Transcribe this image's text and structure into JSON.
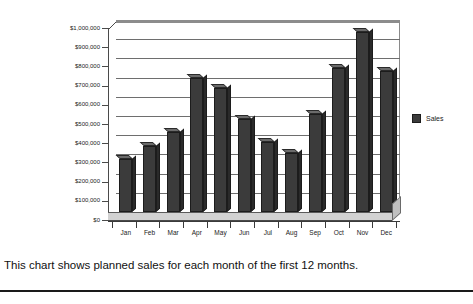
{
  "caption": "This chart shows planned sales for each month of the first 12 months.",
  "legend": {
    "label": "Sales",
    "swatch_color": "#3b3b3b"
  },
  "axis": {
    "y_tick_labels": [
      "$1,000,000",
      "$900,000",
      "$800,000",
      "$700,000",
      "$600,000",
      "$500,000",
      "$400,000",
      "$300,000",
      "$200,000",
      "$100,000",
      "$0"
    ]
  },
  "chart_data": {
    "type": "bar",
    "title": "",
    "subtitle": "",
    "xlabel": "",
    "ylabel": "",
    "categories": [
      "Jan",
      "Feb",
      "Mar",
      "Apr",
      "May",
      "Jun",
      "Jul",
      "Aug",
      "Sep",
      "Oct",
      "Nov",
      "Dec"
    ],
    "series": [
      {
        "name": "Sales",
        "color": "#3b3b3b",
        "values": [
          275000,
          345000,
          415000,
          700000,
          645000,
          485000,
          365000,
          305000,
          512000,
          752000,
          938000,
          735000
        ]
      }
    ],
    "ylim": [
      0,
      1000000
    ],
    "ytick_step": 100000,
    "ytick_labels": [
      "$0",
      "$100,000",
      "$200,000",
      "$300,000",
      "$400,000",
      "$500,000",
      "$600,000",
      "$700,000",
      "$800,000",
      "$900,000",
      "$1,000,000"
    ],
    "grid": true,
    "grid_axis": "y",
    "legend_position": "right",
    "style": "3d-column",
    "annotations": []
  }
}
